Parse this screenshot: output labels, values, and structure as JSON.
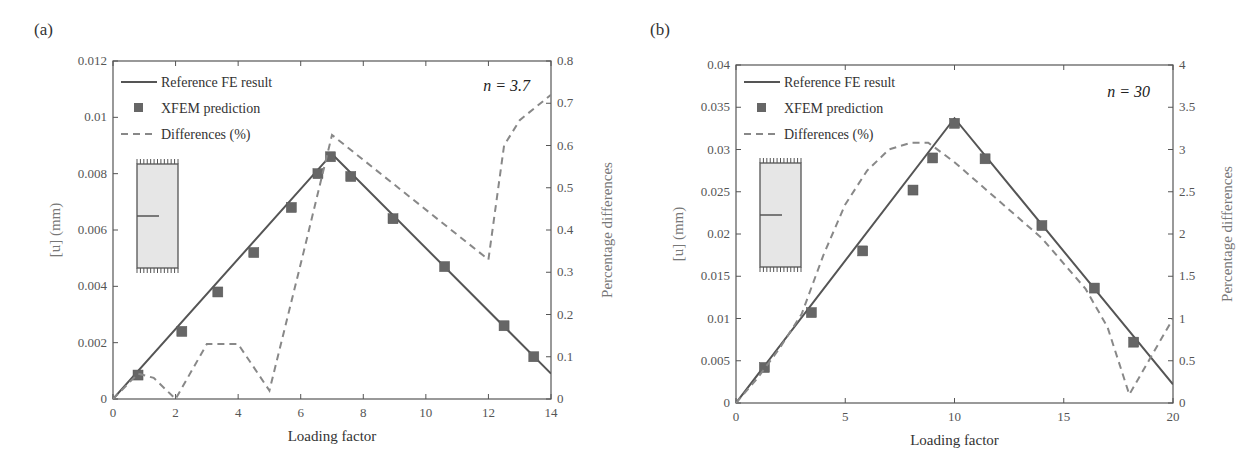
{
  "chart_data": [
    {
      "panel": "(a)",
      "type": "line",
      "annotation": "n = 3.7",
      "xlabel": "Loading factor",
      "ylabel": "[u] (mm)",
      "ylabel_right": "Percentage differences",
      "xlim": [
        0,
        14
      ],
      "ylim": [
        0,
        0.012
      ],
      "ylim_right": [
        0,
        0.8
      ],
      "xticks": [
        "0",
        "2",
        "4",
        "6",
        "8",
        "10",
        "12",
        "14"
      ],
      "yticks": [
        "0",
        "0.002",
        "0.004",
        "0.006",
        "0.008",
        "0.01",
        "0.012"
      ],
      "yticks_right": [
        "0",
        "0.1",
        "0.2",
        "0.3",
        "0.4",
        "0.5",
        "0.6",
        "0.7",
        "0.8"
      ],
      "legend": [
        "Reference FE result",
        "XFEM prediction",
        "Differences (%)"
      ],
      "legend_position": "upper left",
      "grid": false,
      "series": [
        {
          "name": "Reference FE result",
          "style": "solid",
          "axis": "left",
          "x": [
            0,
            7,
            14
          ],
          "y": [
            0,
            0.0087,
            0.0009
          ]
        },
        {
          "name": "XFEM prediction",
          "style": "square-markers",
          "axis": "left",
          "x": [
            0.8,
            2.2,
            3.35,
            4.5,
            5.7,
            6.55,
            6.95,
            7.6,
            8.95,
            10.6,
            12.5,
            13.45
          ],
          "y": [
            0.00085,
            0.0024,
            0.0038,
            0.0052,
            0.0068,
            0.008,
            0.0086,
            0.0079,
            0.0064,
            0.0047,
            0.0026,
            0.0015
          ]
        },
        {
          "name": "Differences (%)",
          "style": "dashed",
          "axis": "right",
          "x": [
            0,
            0.8,
            1.3,
            2,
            3,
            4,
            5,
            6.1,
            7,
            12,
            12.5,
            13,
            13.5,
            14
          ],
          "y": [
            0,
            0.06,
            0.05,
            0.0,
            0.13,
            0.13,
            0.02,
            0.35,
            0.625,
            0.33,
            0.6,
            0.66,
            0.69,
            0.72
          ]
        }
      ]
    },
    {
      "panel": "(b)",
      "type": "line",
      "annotation": "n = 30",
      "xlabel": "Loading factor",
      "ylabel": "[u] (mm)",
      "ylabel_right": "Percentage differences",
      "xlim": [
        0,
        20
      ],
      "ylim": [
        0,
        0.04
      ],
      "ylim_right": [
        0,
        4
      ],
      "xticks": [
        "0",
        "5",
        "10",
        "15",
        "20"
      ],
      "yticks": [
        "0",
        "0.005",
        "0.01",
        "0.015",
        "0.02",
        "0.025",
        "0.03",
        "0.035",
        "0.04"
      ],
      "yticks_right": [
        "0",
        "0.5",
        "1",
        "1.5",
        "2",
        "2.5",
        "3",
        "3.5",
        "4"
      ],
      "legend": [
        "Reference FE result",
        "XFEM prediction",
        "Differences (%)"
      ],
      "legend_position": "upper left",
      "grid": false,
      "series": [
        {
          "name": "Reference FE result",
          "style": "solid",
          "axis": "left",
          "x": [
            0,
            10,
            20
          ],
          "y": [
            0,
            0.0337,
            0.0022
          ]
        },
        {
          "name": "XFEM prediction",
          "style": "square-markers",
          "axis": "left",
          "x": [
            1.3,
            3.45,
            5.8,
            8.1,
            9.0,
            10.0,
            11.4,
            14.0,
            16.4,
            18.2
          ],
          "y": [
            0.0042,
            0.0107,
            0.018,
            0.0252,
            0.029,
            0.0331,
            0.0289,
            0.021,
            0.0136,
            0.0072
          ]
        },
        {
          "name": "Differences (%)",
          "style": "dashed",
          "axis": "right",
          "x": [
            0,
            1,
            2,
            3,
            4,
            5,
            6,
            7,
            8,
            8.8,
            10,
            12,
            14,
            16,
            17,
            18,
            19,
            20
          ],
          "y": [
            0,
            0.3,
            0.65,
            1.05,
            1.75,
            2.35,
            2.75,
            3.0,
            3.08,
            3.08,
            2.85,
            2.4,
            1.95,
            1.35,
            0.9,
            0.1,
            0.55,
            1.0
          ]
        }
      ]
    }
  ],
  "colors": {
    "line": "#555555",
    "marker": "#666666",
    "dashed": "#888888",
    "axis": "#555555",
    "inset_fill": "#e6e6e6"
  }
}
